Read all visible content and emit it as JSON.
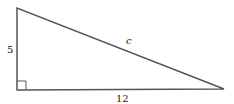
{
  "diagram": {
    "type": "right-triangle",
    "vertices": {
      "top": [
        17,
        8
      ],
      "right_angle": [
        17,
        90
      ],
      "right": [
        224,
        89
      ]
    },
    "labels": {
      "vertical_leg": "5",
      "hypotenuse": "c",
      "horizontal_leg": "12"
    },
    "stroke_color": "#555555",
    "right_angle_marker": true
  }
}
